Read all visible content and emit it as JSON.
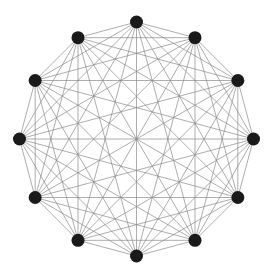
{
  "diagram": {
    "type": "complete-graph",
    "name": "K12",
    "node_count": 12,
    "edge_count": 66,
    "layout": "regular-polygon",
    "center": [
      136.5,
      139
    ],
    "radius": 117,
    "start_angle_deg": -90,
    "node_radius": 6.5,
    "colors": {
      "node": "#1a1a1a",
      "edge": "#8a8a8a",
      "background": "#ffffff"
    }
  }
}
